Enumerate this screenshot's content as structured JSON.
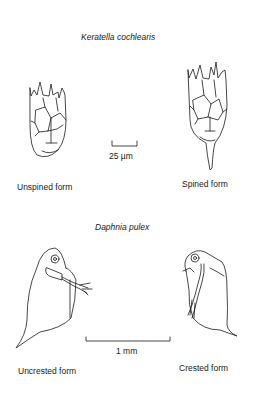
{
  "figure": {
    "panels": [
      {
        "title": "Keratella cochlearis",
        "scale_bar_label": "25 µm",
        "forms": [
          {
            "label": "Unspined form"
          },
          {
            "label": "Spined form"
          }
        ]
      },
      {
        "title": "Daphnia pulex",
        "scale_bar_label": "1 mm",
        "forms": [
          {
            "label": "Uncrested form"
          },
          {
            "label": "Crested form"
          }
        ]
      }
    ]
  }
}
